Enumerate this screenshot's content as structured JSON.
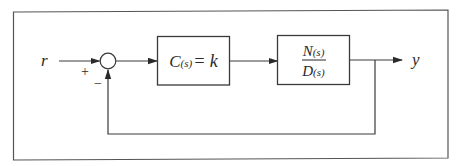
{
  "diagram": {
    "type": "feedback-control-block-diagram",
    "input_label": "r",
    "output_label": "y",
    "summing_junction": {
      "plus_sign": "+",
      "minus_sign": "−"
    },
    "controller_block": {
      "label_main": "C",
      "label_arg": "(s)",
      "label_eq": "= k"
    },
    "plant_block": {
      "numerator_main": "N",
      "numerator_arg": "(s)",
      "denominator_main": "D",
      "denominator_arg": "(s)"
    },
    "colors": {
      "line": "#3a3a3a",
      "text": "#2a2a2a",
      "background": "#ffffff"
    }
  }
}
